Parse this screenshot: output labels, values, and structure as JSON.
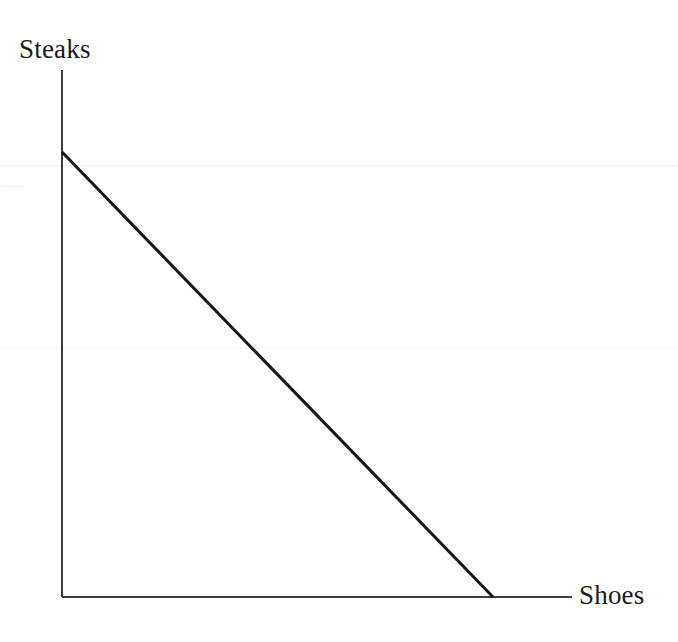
{
  "figure": {
    "kind": "line-chart",
    "background_color": "#ffffff",
    "width": 678,
    "height": 642
  },
  "labels": {
    "y_axis": "Steaks",
    "x_axis": "Shoes"
  },
  "axes": {
    "color": "#3a3a3a",
    "stroke_width": 2,
    "origin": {
      "x": 62,
      "y": 597
    },
    "y_axis_top": {
      "x": 62,
      "y": 70
    },
    "x_axis_right": {
      "x": 572,
      "y": 597
    }
  },
  "ppf_line": {
    "color": "#161616",
    "stroke_width": 3,
    "start": {
      "x": 62,
      "y": 152
    },
    "end": {
      "x": 493,
      "y": 597
    }
  },
  "chart_data": {
    "type": "line",
    "title": "",
    "xlabel": "Shoes",
    "ylabel": "Steaks",
    "x": [
      0,
      100
    ],
    "series": [
      {
        "name": "Production Possibilities Frontier",
        "values": [
          100,
          0
        ]
      }
    ],
    "xlim": [
      0,
      118.4
    ],
    "ylim": [
      0,
      118.2
    ],
    "grid": false,
    "legend": false,
    "tick_labels": {
      "x": [],
      "y": []
    },
    "annotations": []
  }
}
